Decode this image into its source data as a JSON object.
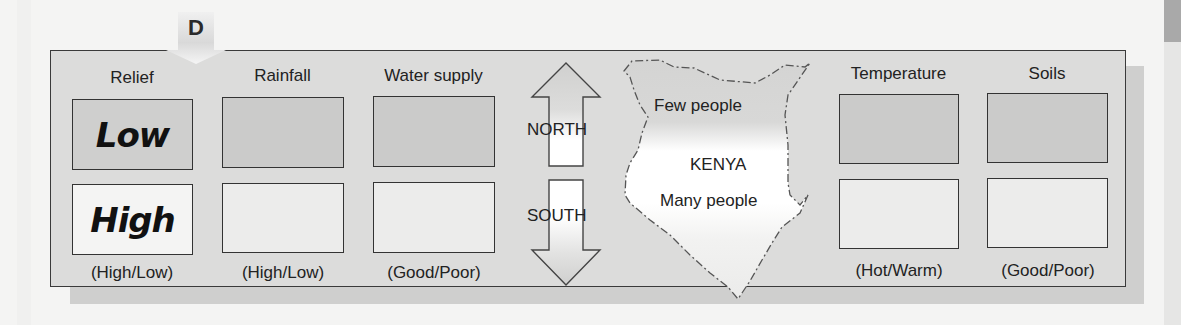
{
  "figure": {
    "tab_letter": "D",
    "columns_left": [
      {
        "title": "Relief",
        "top_value": "Low",
        "bottom_value": "High",
        "options": "(High/Low)"
      },
      {
        "title": "Rainfall",
        "top_value": "",
        "bottom_value": "",
        "options": "(High/Low)"
      },
      {
        "title": "Water supply",
        "top_value": "",
        "bottom_value": "",
        "options": "(Good/Poor)"
      }
    ],
    "directions": {
      "north": "NORTH",
      "south": "SOUTH"
    },
    "map": {
      "country": "KENYA",
      "north_label": "Few people",
      "south_label": "Many people"
    },
    "columns_right": [
      {
        "title": "Temperature",
        "top_value": "",
        "bottom_value": "",
        "options": "(Hot/Warm)"
      },
      {
        "title": "Soils",
        "top_value": "",
        "bottom_value": "",
        "options": "(Good/Poor)"
      }
    ]
  }
}
